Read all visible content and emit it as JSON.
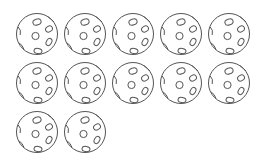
{
  "scene": {
    "description": "counting picture of wiffle balls",
    "total_count": 12,
    "stroke_color": "#555555",
    "background_color": "#ffffff",
    "rows": [
      {
        "count": 5,
        "y": 34
      },
      {
        "count": 5,
        "y": 83
      },
      {
        "count": 2,
        "y": 132
      }
    ],
    "column_x": [
      37,
      85,
      133,
      181,
      229
    ]
  }
}
